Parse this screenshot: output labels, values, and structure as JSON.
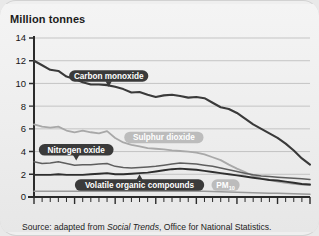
{
  "figure": {
    "axis_title": "Million tonnes",
    "source_prefix": "Source: adapted from ",
    "source_italic": "Social Trends",
    "source_suffix": ", Office for National Statistics."
  },
  "labels": {
    "carbon_monoxide": "Carbon monoxide",
    "sulphur_dioxide": "Sulphur dioxide",
    "nitrogen_oxide": "Nitrogen oxide",
    "voc": "Volatile organic compounds",
    "pm10_main": "PM",
    "pm10_sub": "10"
  },
  "colors": {
    "carbon_monoxide": "#3a3a3a",
    "sulphur_dioxide": "#a8a8a8",
    "nitrogen_oxide": "#5e5e5e",
    "voc": "#2e2e2e",
    "pm10": "#9a9a9a",
    "grid": "#b9b9b9",
    "axis": "#2b2b2b",
    "background": "#efefef"
  },
  "chart_data": {
    "type": "line",
    "title": "",
    "subtitle": "",
    "xlabel": "",
    "ylabel": "Million tonnes",
    "xlim": [
      1970,
      2004
    ],
    "ylim": [
      0,
      14
    ],
    "ytick_values": [
      0,
      2,
      4,
      6,
      8,
      10,
      12,
      14
    ],
    "ytick_labels": [
      "0",
      "2",
      "4",
      "6",
      "8",
      "10",
      "12",
      "14"
    ],
    "xtick_values": [
      1970,
      1975,
      1980,
      1985,
      1990,
      1995,
      2000,
      2004
    ],
    "xtick_labels": [
      "1970",
      "75",
      "80",
      "85",
      "90",
      "95",
      "2000",
      "04"
    ],
    "xtick_minor_step": 1,
    "grid": "horizontal",
    "legend": "inline-callout-labels",
    "x": [
      1970,
      1971,
      1972,
      1973,
      1974,
      1975,
      1976,
      1977,
      1978,
      1979,
      1980,
      1981,
      1982,
      1983,
      1984,
      1985,
      1986,
      1987,
      1988,
      1989,
      1990,
      1991,
      1992,
      1993,
      1994,
      1995,
      1996,
      1997,
      1998,
      1999,
      2000,
      2001,
      2002,
      2003,
      2004
    ],
    "series": [
      {
        "name": "Carbon monoxide",
        "color": "#3a3a3a",
        "values": [
          12.0,
          11.6,
          11.2,
          11.1,
          10.6,
          10.4,
          10.1,
          9.9,
          9.9,
          9.85,
          9.7,
          9.5,
          9.2,
          9.25,
          9.0,
          8.8,
          8.95,
          9.0,
          8.9,
          8.75,
          8.8,
          8.7,
          8.3,
          7.9,
          7.75,
          7.4,
          6.9,
          6.4,
          6.0,
          5.6,
          5.2,
          4.7,
          4.1,
          3.4,
          2.85
        ]
      },
      {
        "name": "Sulphur dioxide",
        "color": "#a8a8a8",
        "values": [
          6.4,
          6.2,
          6.1,
          6.2,
          5.85,
          5.7,
          5.85,
          5.7,
          5.6,
          5.8,
          5.2,
          4.8,
          4.6,
          4.45,
          4.3,
          4.25,
          4.2,
          4.1,
          4.05,
          4.0,
          3.9,
          3.75,
          3.5,
          3.25,
          2.85,
          2.5,
          2.2,
          1.85,
          1.65,
          1.5,
          1.35,
          1.25,
          1.15,
          1.1,
          1.05
        ]
      },
      {
        "name": "Nitrogen oxide",
        "color": "#5e5e5e",
        "values": [
          3.1,
          2.95,
          3.0,
          3.1,
          2.95,
          2.8,
          2.85,
          2.85,
          2.9,
          2.95,
          2.7,
          2.6,
          2.55,
          2.6,
          2.65,
          2.7,
          2.8,
          2.9,
          3.0,
          2.95,
          2.9,
          2.8,
          2.7,
          2.55,
          2.4,
          2.25,
          2.1,
          1.95,
          1.85,
          1.8,
          1.75,
          1.7,
          1.65,
          1.6,
          1.55
        ]
      },
      {
        "name": "Volatile organic compounds",
        "color": "#2e2e2e",
        "values": [
          1.95,
          1.95,
          1.95,
          2.0,
          1.95,
          1.95,
          1.95,
          2.0,
          2.05,
          2.1,
          2.0,
          2.0,
          2.05,
          2.1,
          2.15,
          2.25,
          2.35,
          2.45,
          2.5,
          2.45,
          2.4,
          2.3,
          2.2,
          2.1,
          2.0,
          1.9,
          1.8,
          1.7,
          1.6,
          1.5,
          1.45,
          1.35,
          1.25,
          1.15,
          1.1
        ]
      },
      {
        "name": "PM10",
        "color": "#9a9a9a",
        "values": [
          0.5,
          0.5,
          0.5,
          0.5,
          0.5,
          0.5,
          0.5,
          0.5,
          0.5,
          0.52,
          0.5,
          0.5,
          0.5,
          0.5,
          0.5,
          0.5,
          0.5,
          0.5,
          0.5,
          0.5,
          0.5,
          0.5,
          0.48,
          0.46,
          0.44,
          0.42,
          0.4,
          0.38,
          0.36,
          0.34,
          0.32,
          0.3,
          0.28,
          0.26,
          0.25
        ]
      }
    ],
    "annotations": [
      {
        "text": "Carbon monoxide",
        "x": 1979,
        "y": 10.6,
        "style": "dark-pill-pointer-down"
      },
      {
        "text": "Sulphur dioxide",
        "x": 1986,
        "y": 5.2,
        "style": "light-pill"
      },
      {
        "text": "Nitrogen oxide",
        "x": 1975,
        "y": 4.1,
        "style": "dark-pill-pointer-down"
      },
      {
        "text": "Volatile organic compounds",
        "x": 1983,
        "y": 1.1,
        "style": "dark-pill-pointer-up"
      },
      {
        "text": "PM10",
        "x": 1993,
        "y": 1.1,
        "style": "light-pill"
      }
    ]
  }
}
